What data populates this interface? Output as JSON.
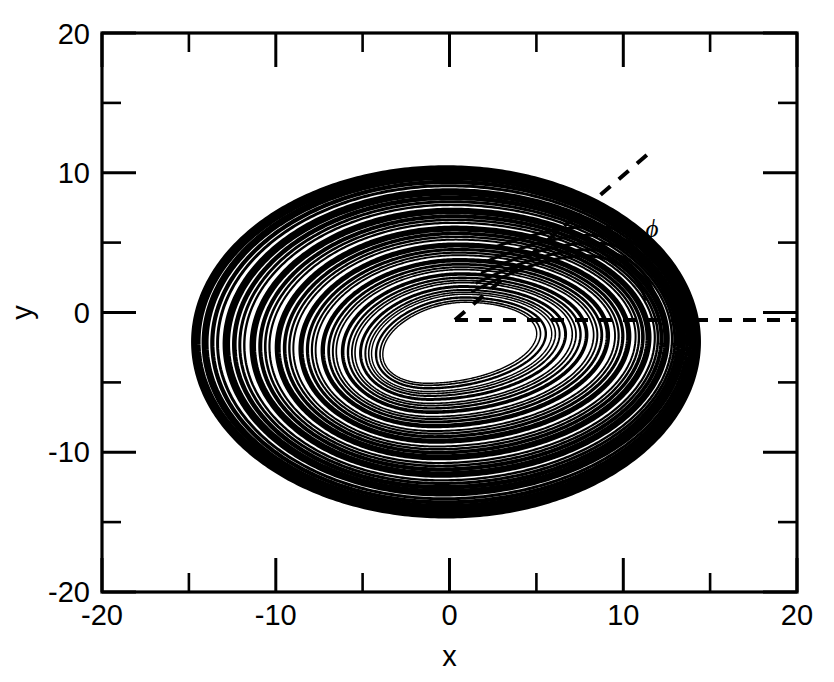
{
  "chart_data": {
    "type": "scatter",
    "title": "",
    "subtitle": "",
    "xlabel": "x",
    "ylabel": "y",
    "xlim": [
      -20,
      20
    ],
    "ylim": [
      -20,
      20
    ],
    "grid": false,
    "legend": null,
    "legend_position": "none",
    "xticks": [
      -20,
      -15,
      -10,
      -5,
      0,
      5,
      10,
      15,
      20
    ],
    "yticks": [
      -20,
      -15,
      -10,
      -5,
      0,
      5,
      10,
      15,
      20
    ],
    "xtick_labels": [
      "-20",
      "",
      "-10",
      "",
      "0",
      "",
      "10",
      "",
      "20"
    ],
    "ytick_labels": [
      "-20",
      "",
      "-10",
      "",
      "0",
      "",
      "10",
      "",
      "20"
    ],
    "xtick_major_labeled": [
      "-20",
      "-10",
      "0",
      "10",
      "20"
    ],
    "ytick_major_labeled": [
      "-20",
      "-10",
      "0",
      "10",
      "20"
    ],
    "ticks_direction": "in",
    "ticks_all_sides": true,
    "series": [
      {
        "name": "chaotic attractor trajectory",
        "style": "dense-black-spiral-bands",
        "color": "#000000",
        "x_range": [
          -11.6,
          14.2
        ],
        "y_range": [
          -14.0,
          10.2
        ],
        "description": "Dense nested quasi-elliptical spiral bands forming a single chaotic attractor; trajectories spiral outward from an inner hole and refold on the right side near x = 7 to 13."
      }
    ],
    "annotations": [
      {
        "name": "angle-vertex",
        "x": 0.6,
        "y": 0.0
      },
      {
        "name": "reference-ray-horizontal",
        "from": [
          0.6,
          0.0
        ],
        "to": [
          20.0,
          0.0
        ],
        "style": "dashed"
      },
      {
        "name": "angle-ray-diagonal",
        "from": [
          0.6,
          0.0
        ],
        "to": [
          11.5,
          11.8
        ],
        "style": "dashed"
      },
      {
        "name": "angle-label",
        "label": "ϕ",
        "x": 11.9,
        "y": 5.3
      }
    ]
  },
  "axes": {
    "x": {
      "title": "x",
      "min_label": "-20",
      "mid_neg_label": "-10",
      "zero_label": "0",
      "mid_pos_label": "10",
      "max_label": "20"
    },
    "y": {
      "title": "y",
      "min_label": "-20",
      "mid_neg_label": "-10",
      "zero_label": "0",
      "mid_pos_label": "10",
      "max_label": "20"
    }
  },
  "annotation_labels": {
    "phi": "ϕ"
  },
  "colors": {
    "foreground": "#000000",
    "background": "#ffffff"
  }
}
